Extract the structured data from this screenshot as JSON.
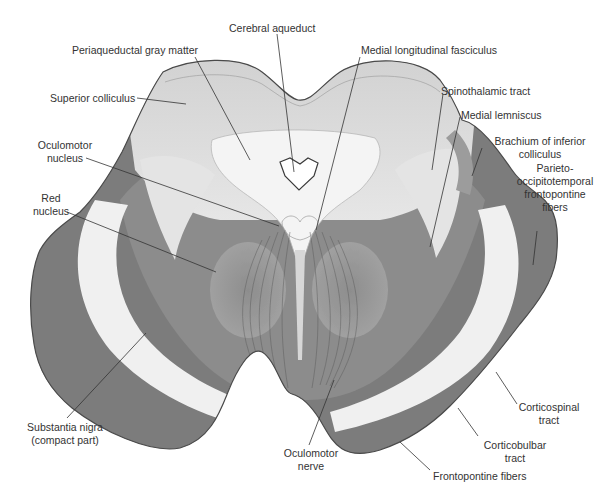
{
  "figure": {
    "colors": {
      "background": "#ffffff",
      "outline": "#4a4a4a",
      "dark_tract": "#777777",
      "mid_gray": "#9a9a9a",
      "light_gray": "#d8d8d8",
      "white_band": "#f2f2f2",
      "leader_line": "#333333",
      "label_text": "#333333"
    }
  },
  "labels": [
    {
      "id": "cerebral-aqueduct",
      "lines": [
        "Cerebral aqueduct"
      ]
    },
    {
      "id": "periaqueductal-gray-matter",
      "lines": [
        "Periaqueductal gray matter"
      ]
    },
    {
      "id": "medial-longitudinal-fasciculus",
      "lines": [
        "Medial longitudinal fasciculus"
      ]
    },
    {
      "id": "superior-colliculus",
      "lines": [
        "Superior colliculus"
      ]
    },
    {
      "id": "spinothalamic-tract",
      "lines": [
        "Spinothalamic tract"
      ]
    },
    {
      "id": "medial-lemniscus",
      "lines": [
        "Medial lemniscus"
      ]
    },
    {
      "id": "oculomotor-nucleus",
      "lines": [
        "Oculomotor",
        "nucleus"
      ]
    },
    {
      "id": "brachium-of-inferior-colliculus",
      "lines": [
        "Brachium of inferior",
        "colliculus"
      ]
    },
    {
      "id": "parieto-occipitotemporal-frontopontine-fibers",
      "lines": [
        "Parieto-",
        "occipitotemporal",
        "frontopontine",
        "fibers"
      ]
    },
    {
      "id": "red-nucleus",
      "lines": [
        "Red",
        "nucleus"
      ]
    },
    {
      "id": "substantia-nigra",
      "lines": [
        "Substantia nigra",
        "(compact part)"
      ]
    },
    {
      "id": "oculomotor-nerve",
      "lines": [
        "Oculomotor",
        "nerve"
      ]
    },
    {
      "id": "corticospinal-tract",
      "lines": [
        "Corticospinal",
        "tract"
      ]
    },
    {
      "id": "corticobulbar-tract",
      "lines": [
        "Corticobulbar",
        "tract"
      ]
    },
    {
      "id": "frontopontine-fibers",
      "lines": [
        "Frontopontine fibers"
      ]
    }
  ]
}
